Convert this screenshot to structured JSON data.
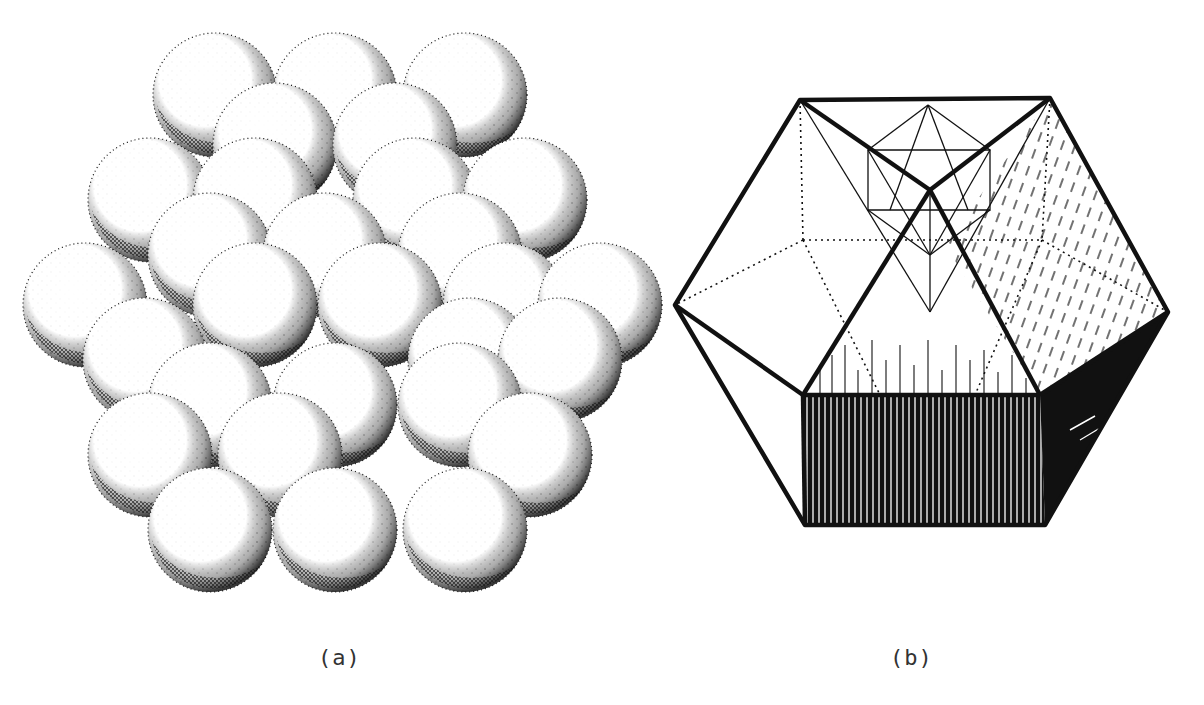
{
  "figure": {
    "panels": [
      {
        "id": "a",
        "label": "(a)",
        "description": "Stippled drawing of close-packed spheres forming a cluster (sphere packing)",
        "sphere_rows": [
          {
            "count": 3,
            "cy": 95,
            "cxs": [
              215,
              335,
              465
            ]
          },
          {
            "count": 2,
            "cy": 145,
            "cxs": [
              275,
              395
            ]
          },
          {
            "count": 4,
            "cy": 200,
            "cxs": [
              150,
              255,
              415,
              525
            ]
          },
          {
            "count": 3,
            "cy": 255,
            "cxs": [
              210,
              325,
              460
            ]
          },
          {
            "count": 5,
            "cy": 305,
            "cxs": [
              85,
              255,
              380,
              505,
              600
            ]
          },
          {
            "count": 3,
            "cy": 360,
            "cxs": [
              145,
              470,
              560
            ]
          },
          {
            "count": 3,
            "cy": 405,
            "cxs": [
              210,
              335,
              460
            ]
          },
          {
            "count": 3,
            "cy": 455,
            "cxs": [
              150,
              280,
              530
            ]
          },
          {
            "count": 3,
            "cy": 530,
            "cxs": [
              210,
              335,
              465
            ]
          }
        ],
        "sphere_radius": 62
      },
      {
        "id": "b",
        "label": "(b)",
        "description": "Line drawing of a polyhedron (cuboctahedron-like hexagonal outline) with inscribed smaller polyhedron, dotted hidden edges, and hatched shaded faces"
      }
    ]
  },
  "colors": {
    "ink": "#111111",
    "paper": "#ffffff",
    "caption": "#333333"
  }
}
